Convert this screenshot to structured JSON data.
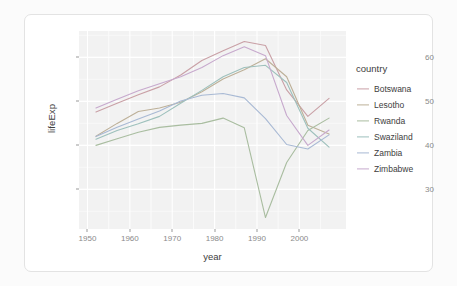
{
  "chart_data": {
    "type": "line",
    "title": "",
    "xlabel": "year",
    "ylabel": "lifeExp",
    "xlim": [
      1948,
      2011
    ],
    "ylim": [
      21,
      66
    ],
    "xticks": [
      1950,
      1960,
      1970,
      1980,
      1990,
      2000
    ],
    "yticks": [
      30,
      40,
      50,
      60
    ],
    "grid": true,
    "legend_title": "country",
    "legend_position": "right",
    "x": [
      1952,
      1957,
      1962,
      1967,
      1972,
      1977,
      1982,
      1987,
      1992,
      1997,
      2002,
      2007
    ],
    "series": [
      {
        "name": "Botswana",
        "color": "#c9a0a6",
        "values": [
          47.6,
          49.6,
          51.5,
          53.3,
          56.0,
          59.3,
          61.5,
          63.6,
          62.7,
          52.6,
          46.6,
          50.7
        ]
      },
      {
        "name": "Lesotho",
        "color": "#bdb098",
        "values": [
          42.1,
          45.0,
          47.7,
          48.5,
          49.8,
          52.2,
          55.1,
          57.2,
          59.7,
          55.6,
          44.6,
          42.6
        ]
      },
      {
        "name": "Rwanda",
        "color": "#a9bda0",
        "values": [
          40.0,
          41.5,
          43.0,
          44.1,
          44.6,
          45.0,
          46.2,
          44.0,
          23.6,
          36.1,
          43.4,
          46.2
        ]
      },
      {
        "name": "Swaziland",
        "color": "#9dc0bc",
        "values": [
          41.4,
          43.4,
          44.9,
          46.6,
          49.6,
          52.5,
          55.6,
          57.7,
          58.2,
          54.3,
          43.9,
          39.6
        ]
      },
      {
        "name": "Zambia",
        "color": "#a8b9d4",
        "values": [
          42.0,
          44.1,
          46.0,
          47.8,
          50.1,
          51.4,
          51.8,
          50.8,
          46.1,
          40.2,
          39.2,
          42.4
        ]
      },
      {
        "name": "Zimbabwe",
        "color": "#c7a9cd",
        "values": [
          48.5,
          50.5,
          52.4,
          54.0,
          55.6,
          57.7,
          60.4,
          62.4,
          60.4,
          46.8,
          40.0,
          43.5
        ]
      }
    ]
  },
  "panel": {
    "background_color": "#f2f2f2",
    "grid_major_color": "#ffffff",
    "grid_minor_color": "#fafafa"
  },
  "card": {
    "background_color": "#ffffff",
    "border_color": "#e3e3e3"
  },
  "axis": {
    "x_title": "year",
    "y_title": "lifeExp",
    "tick_label_color": "#8a8a8a"
  },
  "legend": {
    "title": "country",
    "items": [
      {
        "label": "Botswana",
        "color": "#c9a0a6"
      },
      {
        "label": "Lesotho",
        "color": "#bdb098"
      },
      {
        "label": "Rwanda",
        "color": "#a9bda0"
      },
      {
        "label": "Swaziland",
        "color": "#9dc0bc"
      },
      {
        "label": "Zambia",
        "color": "#a8b9d4"
      },
      {
        "label": "Zimbabwe",
        "color": "#c7a9cd"
      }
    ]
  }
}
